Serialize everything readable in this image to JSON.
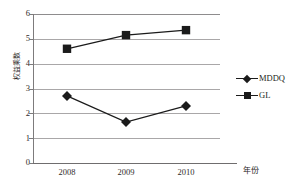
{
  "chart_data": {
    "type": "line",
    "title": "",
    "xlabel": "年份",
    "ylabel": "权益乘数",
    "categories": [
      "2008",
      "2009",
      "2010"
    ],
    "series": [
      {
        "name": "MDDQ",
        "marker": "diamond",
        "color": "#1b1b1b",
        "values": [
          2.7,
          1.65,
          2.3
        ]
      },
      {
        "name": "GL",
        "marker": "square",
        "color": "#1b1b1b",
        "values": [
          4.6,
          5.15,
          5.35
        ]
      }
    ],
    "ylim": [
      0,
      6
    ],
    "ytick_labels": [
      "0",
      "1",
      "2",
      "3",
      "4",
      "5",
      "6"
    ],
    "ytick_values": [
      0,
      1,
      2,
      3,
      4,
      5,
      6
    ],
    "grid": true,
    "legend_position": "right"
  },
  "legend": {
    "entries": [
      {
        "label": "MDDQ",
        "marker": "diamond"
      },
      {
        "label": "GL",
        "marker": "square"
      }
    ]
  },
  "axes": {
    "y_title": "权益乘数",
    "x_title": "年份",
    "y_ticks": [
      "6",
      "5",
      "4",
      "3",
      "2",
      "1",
      "0"
    ],
    "x_ticks": [
      "2008",
      "2009",
      "2010"
    ]
  }
}
